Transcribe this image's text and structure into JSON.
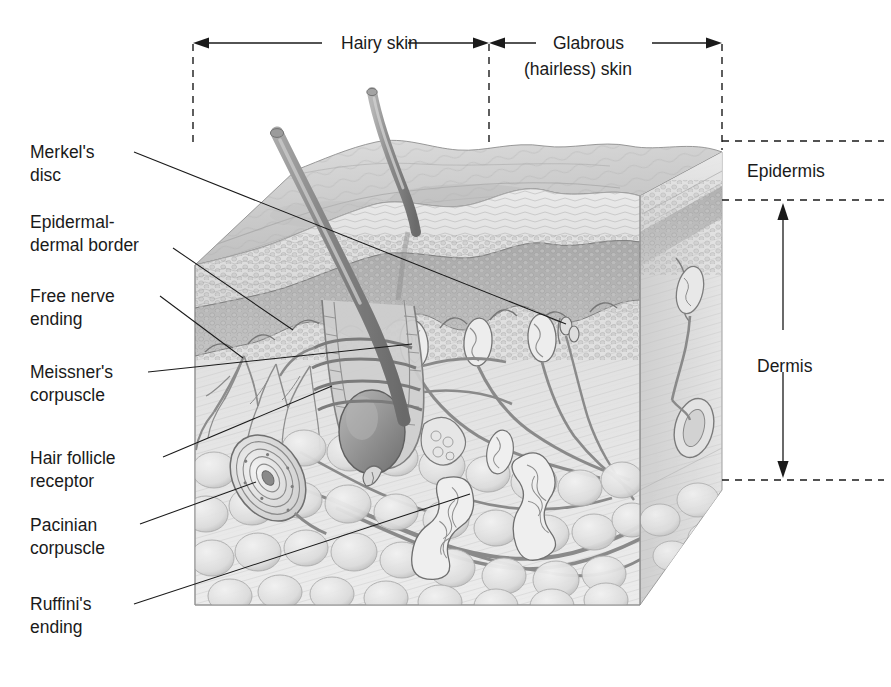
{
  "figure": {
    "type": "anatomical-illustration",
    "style": "grayscale airbrush / pencil rendering",
    "background_color": "#ffffff",
    "ink_color": "#1a1a1a"
  },
  "top_brackets": [
    {
      "label": "Hairy skin",
      "label2": ""
    },
    {
      "label": "Glabrous",
      "label2": "(hairless) skin"
    }
  ],
  "right_labels": {
    "epidermis": "Epidermis",
    "dermis": "Dermis"
  },
  "left_labels": [
    {
      "line1": "Merkel's",
      "line2": "disc"
    },
    {
      "line1": "Epidermal-",
      "line2": "dermal border"
    },
    {
      "line1": "Free nerve",
      "line2": "ending"
    },
    {
      "line1": "Meissner's",
      "line2": "corpuscle"
    },
    {
      "line1": "Hair follicle",
      "line2": "receptor"
    },
    {
      "line1": "Pacinian",
      "line2": "corpuscle"
    },
    {
      "line1": "Ruffini's",
      "line2": "ending"
    }
  ],
  "structures": [
    "hair-shaft-thick",
    "hair-shaft-thin",
    "stratum-corneum",
    "epidermal-granular-layer",
    "dermal-papillae",
    "hair-follicle",
    "hair-bulb",
    "sebaceous-gland",
    "free-nerve-ending-plexus",
    "merkel-disc",
    "meissner-corpuscle",
    "pacinian-corpuscle",
    "ruffini-ending",
    "subcutaneous-fat-lobules",
    "nerve-trunk"
  ],
  "palette": {
    "skin_light": "#dcdcdc",
    "skin_mid": "#c2c2c2",
    "skin_dark": "#9d9d9d",
    "nerve": "#8a8a8a",
    "outline": "#6f6f6f"
  }
}
